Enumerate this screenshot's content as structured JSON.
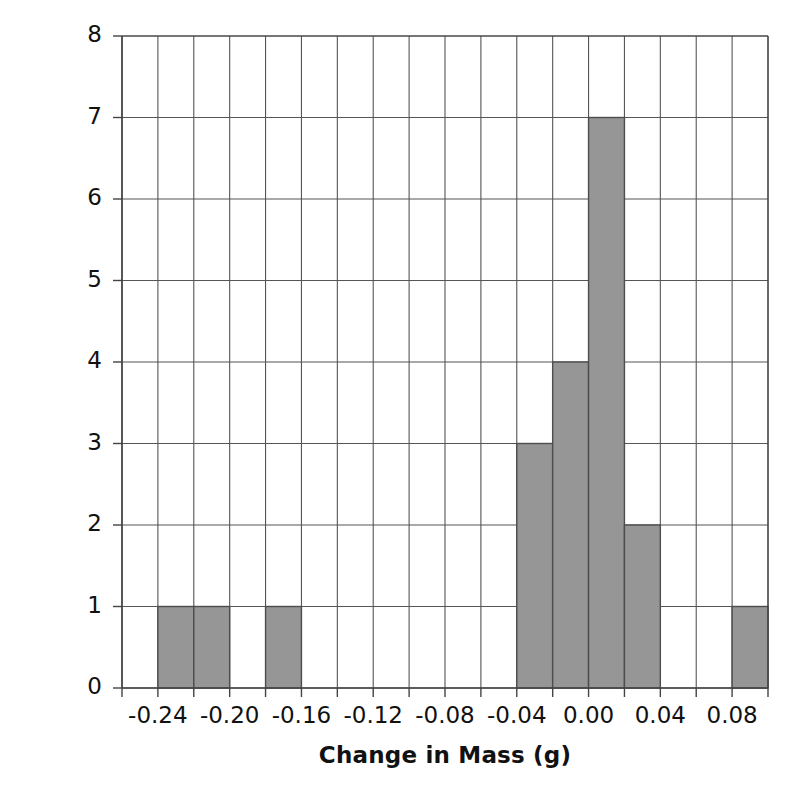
{
  "chart_data": {
    "type": "bar",
    "title": "",
    "subtitle": "",
    "xlabel": "Change in Mass (g)",
    "ylabel": "Count",
    "xlim": [
      -0.26,
      0.1
    ],
    "ylim": [
      0,
      8
    ],
    "bin_width": 0.02,
    "grid": true,
    "grid_x_step": 0.02,
    "grid_y_step": 1,
    "legend": null,
    "legend_position": "none",
    "bar_color": "#969696",
    "bar_edge_color": "#4d4d4d",
    "axis_color": "#444444",
    "grid_color": "#555555",
    "x_ticks": [
      -0.24,
      -0.2,
      -0.16,
      -0.12,
      -0.08,
      -0.04,
      0.0,
      0.04,
      0.08
    ],
    "x_tick_labels": [
      "-0.24",
      "-0.20",
      "-0.16",
      "-0.12",
      "-0.08",
      "-0.04",
      "0.00",
      "0.04",
      "0.08"
    ],
    "y_ticks": [
      0,
      1,
      2,
      3,
      4,
      5,
      6,
      7,
      8
    ],
    "y_tick_labels": [
      "0",
      "1",
      "2",
      "3",
      "4",
      "5",
      "6",
      "7",
      "8"
    ],
    "bins": [
      {
        "left": -0.26,
        "right": -0.24,
        "count": 0
      },
      {
        "left": -0.24,
        "right": -0.22,
        "count": 1
      },
      {
        "left": -0.22,
        "right": -0.2,
        "count": 1
      },
      {
        "left": -0.2,
        "right": -0.18,
        "count": 0
      },
      {
        "left": -0.18,
        "right": -0.16,
        "count": 1
      },
      {
        "left": -0.16,
        "right": -0.14,
        "count": 0
      },
      {
        "left": -0.14,
        "right": -0.12,
        "count": 0
      },
      {
        "left": -0.12,
        "right": -0.1,
        "count": 0
      },
      {
        "left": -0.1,
        "right": -0.08,
        "count": 0
      },
      {
        "left": -0.08,
        "right": -0.06,
        "count": 0
      },
      {
        "left": -0.06,
        "right": -0.04,
        "count": 0
      },
      {
        "left": -0.04,
        "right": -0.02,
        "count": 3
      },
      {
        "left": -0.02,
        "right": 0.0,
        "count": 4
      },
      {
        "left": 0.0,
        "right": 0.02,
        "count": 7
      },
      {
        "left": 0.02,
        "right": 0.04,
        "count": 2
      },
      {
        "left": 0.04,
        "right": 0.06,
        "count": 0
      },
      {
        "left": 0.06,
        "right": 0.08,
        "count": 0
      },
      {
        "left": 0.08,
        "right": 0.1,
        "count": 1
      }
    ],
    "categories": [
      "-0.23",
      "-0.21",
      "-0.17",
      "-0.03",
      "-0.01",
      "0.01",
      "0.03",
      "0.09"
    ],
    "values": [
      1,
      1,
      1,
      3,
      4,
      7,
      2,
      1
    ],
    "total_count": 20
  }
}
